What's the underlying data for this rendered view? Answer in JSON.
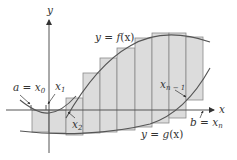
{
  "diagram": {
    "axes": {
      "x_label": "x",
      "y_label": "y"
    },
    "curves": {
      "top": {
        "label_prefix": "y = ",
        "label_fn": "f",
        "label_arg": "(x)"
      },
      "bottom": {
        "label_prefix": "y = ",
        "label_fn": "g",
        "label_arg": "(x)"
      }
    },
    "points": {
      "a": {
        "lhs": "a",
        "eq": " = ",
        "var": "x",
        "sub": "0"
      },
      "x1": {
        "var": "x",
        "sub": "1"
      },
      "x2": {
        "var": "x",
        "sub": "2"
      },
      "xn_minus_1": {
        "var": "x",
        "sub": "n − 1"
      },
      "b": {
        "lhs": "b",
        "eq": " = ",
        "var": "x",
        "sub": "n"
      }
    },
    "rectangles": {
      "count": 10,
      "fill": "#dcdcdc",
      "stroke": "#8a8a8a"
    },
    "colors": {
      "axis": "#555555",
      "curve": "#555555",
      "text": "#333333"
    }
  }
}
